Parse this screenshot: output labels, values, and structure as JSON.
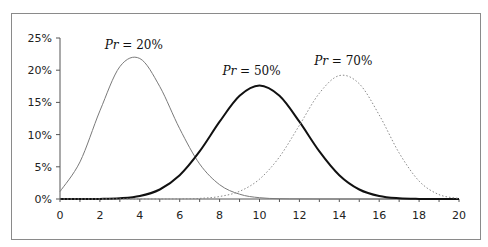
{
  "chart_data": {
    "type": "line",
    "title": "",
    "xlabel": "",
    "ylabel": "",
    "x": [
      0,
      1,
      2,
      3,
      4,
      5,
      6,
      7,
      8,
      9,
      10,
      11,
      12,
      13,
      14,
      15,
      16,
      17,
      18,
      19,
      20
    ],
    "xlim": [
      0,
      20
    ],
    "ylim": [
      0,
      25
    ],
    "x_ticks": [
      "0",
      "2",
      "4",
      "6",
      "8",
      "10",
      "12",
      "14",
      "16",
      "18",
      "20"
    ],
    "y_ticks": [
      "0%",
      "5%",
      "10%",
      "15%",
      "20%",
      "25%"
    ],
    "grid": false,
    "legend": "inline labels",
    "series": [
      {
        "name": "Pr = 20%",
        "style": "thin-gray-solid",
        "values": [
          1.15,
          5.76,
          13.69,
          20.54,
          21.82,
          17.46,
          10.91,
          5.45,
          2.22,
          0.74,
          0.2,
          0.05,
          0.01,
          0.0,
          0.0,
          0.0,
          0.0,
          0.0,
          0.0,
          0.0,
          0.0
        ]
      },
      {
        "name": "Pr = 50%",
        "style": "thick-black-solid",
        "values": [
          0.0,
          0.0,
          0.02,
          0.11,
          0.46,
          1.48,
          3.7,
          7.39,
          12.01,
          16.02,
          17.62,
          16.02,
          12.01,
          7.39,
          3.7,
          1.48,
          0.46,
          0.11,
          0.02,
          0.0,
          0.0
        ]
      },
      {
        "name": "Pr = 70%",
        "style": "dotted-gray",
        "values": [
          0.0,
          0.0,
          0.0,
          0.0,
          0.0,
          0.0,
          0.02,
          0.1,
          0.39,
          1.2,
          3.08,
          6.54,
          11.44,
          16.43,
          19.16,
          17.89,
          13.04,
          7.16,
          2.78,
          0.68,
          0.08
        ]
      }
    ],
    "annotations": [
      {
        "text_italic": "Pr",
        "text_rest": " = 20%",
        "x": 3.7,
        "y": 23.3
      },
      {
        "text_italic": "Pr",
        "text_rest": " = 50%",
        "x": 9.6,
        "y": 19.3
      },
      {
        "text_italic": "Pr",
        "text_rest": " = 70%",
        "x": 14.2,
        "y": 20.8
      }
    ]
  }
}
